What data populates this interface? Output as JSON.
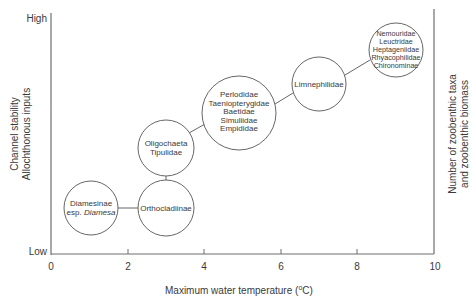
{
  "diagram": {
    "type": "bubble-diagram",
    "x_axis": {
      "label": "Maximum water temperature (°C)",
      "label_main": "Maximum water temperature (",
      "label_sup": "o",
      "label_end": "C)",
      "ticks": [
        "0",
        "2",
        "4",
        "6",
        "8",
        "10"
      ],
      "range": [
        0,
        10
      ]
    },
    "y_axis_left": {
      "line1": "Channel stability",
      "line2": "Allochthonous inputs",
      "high": "High",
      "low": "Low"
    },
    "y_axis_right": {
      "line1": "Number of zoobenthic taxa",
      "line2": "and zoobenthic biomass"
    },
    "nodes": [
      {
        "id": "diamesinae",
        "lines": [
          "Diamesinae",
          "esp. "
        ],
        "italic": "Diamesa",
        "x": 1.05,
        "level": "lowest"
      },
      {
        "id": "orthocladiinae",
        "lines": [
          "Orthocladiinae"
        ],
        "x": 3.0,
        "level": "low"
      },
      {
        "id": "oligochaeta",
        "lines": [
          "Oligochaeta",
          "Tipulidae"
        ],
        "x": 3.0,
        "level": "mid-low"
      },
      {
        "id": "perlodidae",
        "lines": [
          "Perlodidae",
          "Taeniopterygidae",
          "Baetidae",
          "Simuliidae",
          "Empididae"
        ],
        "x": 5.0,
        "level": "mid"
      },
      {
        "id": "limnephilidae",
        "lines": [
          "Limnephilidae"
        ],
        "x": 7.0,
        "level": "mid-high"
      },
      {
        "id": "nemouridae",
        "lines": [
          "Nemouridae",
          "Leuctridae",
          "Heptageniidae",
          "Rhyacophilidae",
          "Chironominae"
        ],
        "x": 9.0,
        "level": "high"
      }
    ],
    "connections": [
      [
        "diamesinae",
        "orthocladiinae"
      ],
      [
        "orthocladiinae",
        "oligochaeta"
      ],
      [
        "oligochaeta",
        "perlodidae"
      ],
      [
        "perlodidae",
        "limnephilidae"
      ],
      [
        "limnephilidae",
        "nemouridae"
      ]
    ]
  }
}
